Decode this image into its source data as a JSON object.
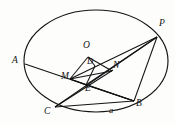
{
  "figure": {
    "type": "geometry-diagram",
    "stroke_color": "#141414",
    "background_color": "#fdfdfc",
    "label_color": "#141414"
  },
  "ellipse": {
    "center_x": 96,
    "center_y": 61,
    "radius_x": 72,
    "radius_y": 51,
    "rotation_deg": 0
  },
  "points": [
    {
      "id": "A",
      "label": "A",
      "x": 25,
      "y": 64,
      "label_x": 12,
      "label_y": 57,
      "on_ellipse": true
    },
    {
      "id": "P",
      "label": "P",
      "x": 157,
      "y": 37,
      "label_x": 159,
      "label_y": 20,
      "on_ellipse": true
    },
    {
      "id": "C",
      "label": "C",
      "x": 55,
      "y": 107,
      "label_x": 45,
      "label_y": 108,
      "on_ellipse": true
    },
    {
      "id": "B",
      "label": "B",
      "x": 134,
      "y": 101,
      "label_x": 136,
      "label_y": 101,
      "on_ellipse": true
    },
    {
      "id": "O",
      "label": "O",
      "x": 88,
      "y": 57,
      "label_x": 84,
      "label_y": 42,
      "on_ellipse": false
    },
    {
      "id": "D",
      "label": "D",
      "x": 90,
      "y": 68,
      "label_x": 87,
      "label_y": 58,
      "on_ellipse": false
    },
    {
      "id": "N",
      "label": "N",
      "x": 110,
      "y": 71,
      "label_x": 113,
      "label_y": 62,
      "on_ellipse": false
    },
    {
      "id": "M",
      "label": "M",
      "x": 73,
      "y": 77,
      "label_x": 63,
      "label_y": 73,
      "on_ellipse": false
    },
    {
      "id": "E",
      "label": "E",
      "x": 89,
      "y": 82,
      "label_x": 86,
      "label_y": 84,
      "on_ellipse": false
    }
  ],
  "annotations": [
    {
      "id": "a",
      "label": "a",
      "label_x": 110,
      "label_y": 107,
      "note": "segment label on chord CB"
    }
  ],
  "segments": [
    {
      "id": "A-B",
      "from": "A",
      "to": "B"
    },
    {
      "id": "C-B",
      "from": "C",
      "to": "B"
    },
    {
      "id": "C-P",
      "from": "C",
      "to": "P"
    },
    {
      "id": "C-N",
      "from": "C",
      "to": "N"
    },
    {
      "id": "B-P",
      "from": "B",
      "to": "P"
    },
    {
      "id": "M-P",
      "from": "M",
      "to": "P"
    },
    {
      "id": "E-P",
      "from": "E",
      "to": "P"
    },
    {
      "id": "O-M",
      "from": "O",
      "to": "M"
    },
    {
      "id": "O-D",
      "from": "O",
      "to": "D"
    },
    {
      "id": "O-N",
      "from": "O",
      "to": "N"
    },
    {
      "id": "M-N",
      "from": "M",
      "to": "N"
    },
    {
      "id": "M-E",
      "from": "M",
      "to": "E"
    },
    {
      "id": "D-E",
      "from": "D",
      "to": "E"
    },
    {
      "id": "E-B",
      "from": "E",
      "to": "B"
    },
    {
      "id": "M-B",
      "from": "M",
      "to": "B"
    }
  ]
}
